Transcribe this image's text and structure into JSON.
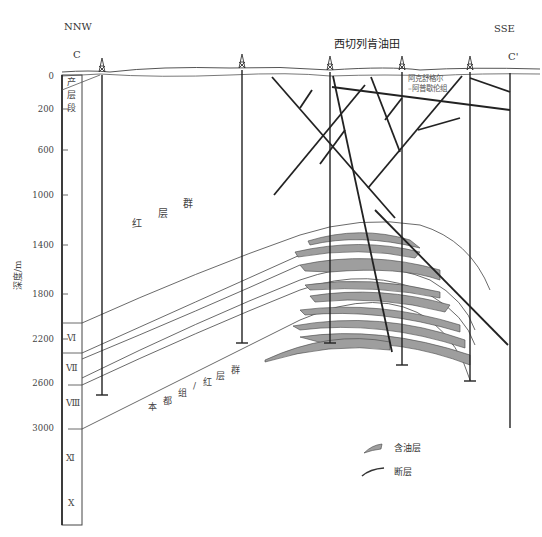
{
  "header": {
    "left_direction": "NNW",
    "right_direction": "SSE",
    "left_section_mark": "C",
    "right_section_mark": "C'",
    "field_name": "西切列肯油田"
  },
  "axis": {
    "label": "深度/m",
    "ticks": [
      "0",
      "200",
      "600",
      "1000",
      "1400",
      "1800",
      "2200",
      "2600",
      "3000"
    ]
  },
  "strat_column": {
    "top_unit": [
      "产",
      "层",
      "段"
    ],
    "units": [
      "Ⅵ",
      "Ⅶ",
      "Ⅷ",
      "Ⅺ",
      "Ⅹ"
    ]
  },
  "formation_labels": {
    "red_group": [
      "红",
      "层",
      "群"
    ],
    "lower_group": [
      "本",
      "都",
      "组",
      "/",
      "红",
      "层",
      "群"
    ],
    "akchagyl": [
      "阿克舒格尔",
      "–阿普歇伦组"
    ]
  },
  "legend": {
    "items": [
      {
        "label": "含油层",
        "symbol": "oil-layer"
      },
      {
        "label": "断层",
        "symbol": "fault"
      }
    ]
  },
  "colors": {
    "oil_layer": "#9e9e9e",
    "line": "#222222",
    "thin_line": "#555555"
  }
}
